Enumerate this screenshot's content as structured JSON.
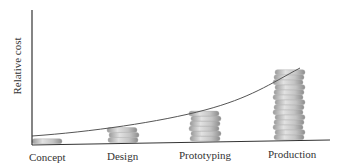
{
  "chart_data": {
    "type": "bar",
    "title": "",
    "xlabel": "",
    "ylabel": "Relative cost",
    "categories": [
      "Concept",
      "Design",
      "Prototyping",
      "Production"
    ],
    "values": [
      1,
      3,
      6,
      14
    ],
    "value_unit": "coins (stacked coin pictogram)",
    "trend_curve": "exponential curve rising across stack tops",
    "grid": false,
    "legend": null,
    "ylim": [
      0,
      27
    ]
  },
  "colors": {
    "axis": "#333333",
    "coin_light": "#e0e0e0",
    "coin_mid": "#b5b5b5",
    "coin_dark": "#8a8a8a",
    "curve": "#555555"
  }
}
